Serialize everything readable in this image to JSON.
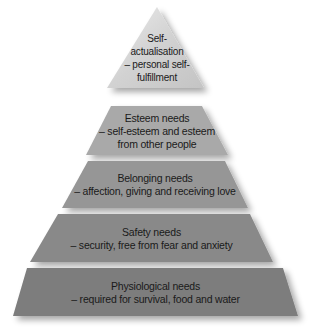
{
  "diagram": {
    "type": "pyramid",
    "tiers": [
      {
        "id": "self-actualisation",
        "lines": [
          "Self-",
          "actualisation",
          "– personal self-",
          "fulfillment"
        ],
        "color": "#d2d2d2"
      },
      {
        "id": "esteem",
        "title": "Esteem needs",
        "lines": [
          "– self-esteem and esteem",
          "from other people"
        ],
        "color": "#a9a9a9"
      },
      {
        "id": "belonging",
        "title": "Belonging needs",
        "lines": [
          "– affection, giving and receiving love"
        ],
        "color": "#969696"
      },
      {
        "id": "safety",
        "title": "Safety needs",
        "lines": [
          "– security, free from fear and anxiety"
        ],
        "color": "#898989"
      },
      {
        "id": "physiological",
        "title": "Physiological needs",
        "lines": [
          "– required for survival, food and water"
        ],
        "color": "#7d7d7d"
      }
    ]
  }
}
